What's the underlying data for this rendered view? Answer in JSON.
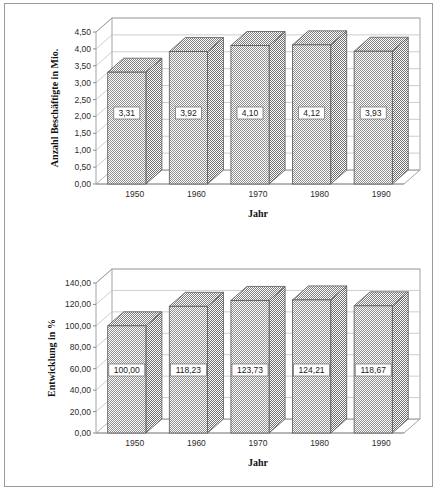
{
  "page": {
    "background_color": "#ffffff",
    "frame_color": "#9a9a9a"
  },
  "style": {
    "bar_fill": "#c0c0c0",
    "bar_top_fill": "#b4b4b4",
    "bar_side_fill": "#a8a8a8",
    "bar_stroke": "#595959",
    "grid_color": "#b9b9b9",
    "text_color": "#2b2b2b"
  },
  "chart_data": [
    {
      "id": "employees",
      "type": "bar",
      "title": "",
      "xlabel": "Jahr",
      "ylabel": "Anzahl Beschäftigte in Mio.",
      "categories": [
        "1950",
        "1960",
        "1970",
        "1980",
        "1990"
      ],
      "values": [
        3.31,
        3.92,
        4.1,
        4.12,
        3.93
      ],
      "value_labels": [
        "3,31",
        "3,92",
        "4,10",
        "4,12",
        "3,93"
      ],
      "ylim": [
        0,
        4.5
      ],
      "ytick_values": [
        0,
        0.5,
        1.0,
        1.5,
        2.0,
        2.5,
        3.0,
        3.5,
        4.0,
        4.5
      ],
      "ytick_labels": [
        "0,00",
        "0,50",
        "1,00",
        "1,50",
        "2,00",
        "2,50",
        "3,00",
        "3,50",
        "4,00",
        "4,50"
      ],
      "grid": true,
      "legend": "none",
      "three_d": true
    },
    {
      "id": "development",
      "type": "bar",
      "title": "",
      "xlabel": "Jahr",
      "ylabel": "Entwicklung in %",
      "categories": [
        "1950",
        "1960",
        "1970",
        "1980",
        "1990"
      ],
      "values": [
        100.0,
        118.23,
        123.73,
        124.21,
        118.67
      ],
      "value_labels": [
        "100,00",
        "118,23",
        "123,73",
        "124,21",
        "118,67"
      ],
      "ylim": [
        0,
        140
      ],
      "ytick_values": [
        0,
        20,
        40,
        60,
        80,
        100,
        120,
        140
      ],
      "ytick_labels": [
        "0,00",
        "20,00",
        "40,00",
        "60,00",
        "80,00",
        "100,00",
        "120,00",
        "140,00"
      ],
      "grid": true,
      "legend": "none",
      "three_d": true
    }
  ]
}
